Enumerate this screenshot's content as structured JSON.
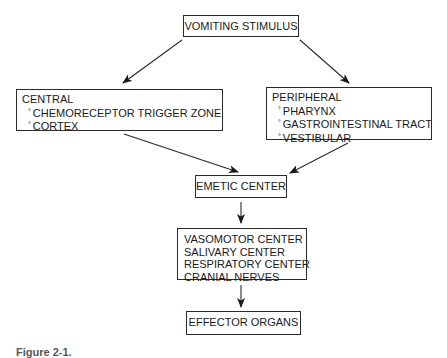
{
  "diagram": {
    "type": "flowchart",
    "nodes": {
      "stimulus": {
        "label": "VOMITING STIMULUS"
      },
      "central": {
        "title": "CENTRAL",
        "items": [
          "CHEMORECEPTOR TRIGGER ZONE",
          "CORTEX"
        ]
      },
      "peripheral": {
        "title": "PERIPHERAL",
        "items": [
          "PHARYNX",
          "GASTROINTESTINAL TRACT",
          "VESTIBULAR"
        ]
      },
      "emetic_center": {
        "label": "EMETIC CENTER"
      },
      "centers": {
        "lines": [
          "VASOMOTOR CENTER",
          "SALIVARY CENTER",
          "RESPIRATORY CENTER",
          "CRANIAL NERVES"
        ]
      },
      "effector": {
        "label": "EFFECTOR ORGANS"
      }
    },
    "edges": [
      {
        "from": "stimulus",
        "to": "central"
      },
      {
        "from": "stimulus",
        "to": "peripheral"
      },
      {
        "from": "central",
        "to": "emetic_center"
      },
      {
        "from": "peripheral",
        "to": "emetic_center"
      },
      {
        "from": "emetic_center",
        "to": "centers"
      },
      {
        "from": "centers",
        "to": "effector"
      }
    ],
    "bullet_glyph": "°",
    "line_color": "#2a2a2a"
  },
  "caption": {
    "text": "Figure 2-1."
  }
}
